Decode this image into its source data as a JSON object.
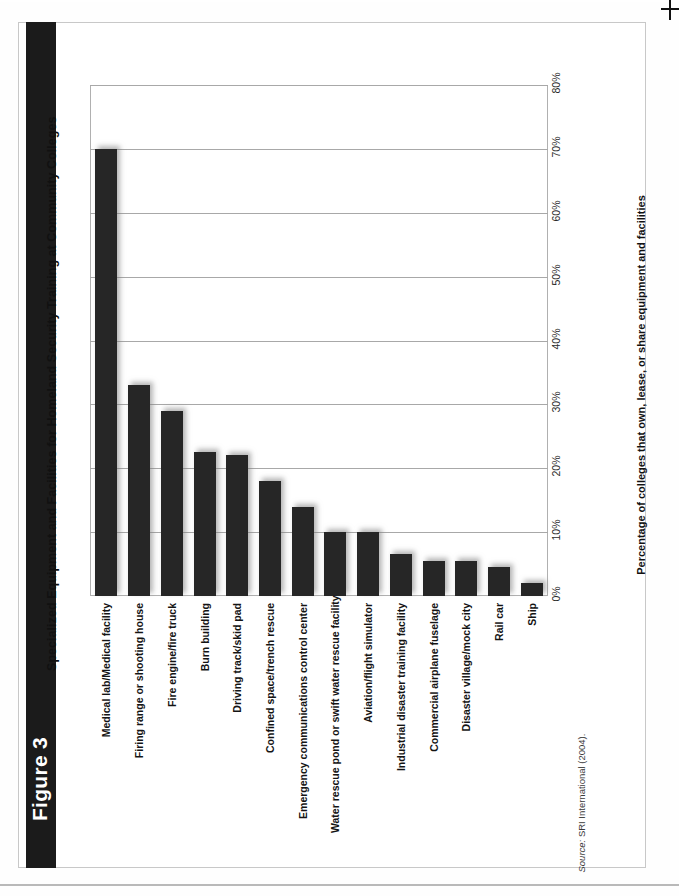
{
  "figure": {
    "number_label": "Figure 3",
    "title": "Specialized Equipment and Facilities for Homeland Security Training at Community Colleges",
    "source_prefix": "Source:",
    "source_text": " SRI International (2004)."
  },
  "chart_data": {
    "type": "bar",
    "orientation": "vertical",
    "title": "Specialized Equipment and Facilities for Homeland Security Training at Community Colleges",
    "xlabel": "",
    "ylabel": "Percentage of colleges that own, lease, or share equipment and facilities",
    "ylim": [
      0,
      80
    ],
    "grid": true,
    "legend": false,
    "tick_labels": [
      "0%",
      "10%",
      "20%",
      "30%",
      "40%",
      "50%",
      "60%",
      "70%",
      "80%"
    ],
    "tick_values": [
      0,
      10,
      20,
      30,
      40,
      50,
      60,
      70,
      80
    ],
    "categories": [
      "Medical lab/Medical facility",
      "Firing range or shooting house",
      "Fire engine/fire truck",
      "Burn building",
      "Driving track/skid pad",
      "Confined space/trench rescue",
      "Emergency communications control center",
      "Water rescue pond or swift water rescue facility",
      "Aviation/flight simulator",
      "Industrial disaster training facility",
      "Commercial airplane fuselage",
      "Disaster village/mock city",
      "Rail car",
      "Ship"
    ],
    "values": [
      70,
      33,
      29,
      22.5,
      22,
      18,
      14,
      10,
      10,
      6.5,
      5.5,
      5.5,
      4.5,
      2
    ],
    "bar_color": "#262626",
    "grid_color": "#a8a8a8"
  },
  "colors": {
    "spine": "#1b1b1b",
    "bar": "#262626",
    "grid": "#a8a8a8",
    "frame": "#b0b0b0"
  }
}
